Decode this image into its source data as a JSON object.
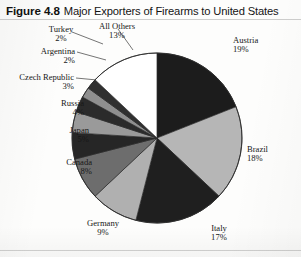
{
  "figure": {
    "number": "Figure 4.8",
    "title": "Major Exporters of Firearms to United States"
  },
  "chart_data": {
    "type": "pie",
    "title": "Major Exporters of Firearms to United States",
    "xlabel": "",
    "ylabel": "",
    "legend_position": "none-external-labels",
    "units": "percent",
    "categories": [
      "Austria",
      "Brazil",
      "Italy",
      "Germany",
      "Canada",
      "Japan",
      "Russia",
      "Czech Republic",
      "Argentina",
      "Turkey",
      "All Others"
    ],
    "values": [
      19,
      18,
      17,
      9,
      8,
      5,
      4,
      3,
      2,
      2,
      13
    ],
    "start_angle_deg": 0,
    "direction": "clockwise",
    "slices": [
      {
        "name": "Austria",
        "value": 19,
        "label": "Austria",
        "pct_label": "19%",
        "color": "#1c1c1c"
      },
      {
        "name": "Brazil",
        "value": 18,
        "label": "Brazil",
        "pct_label": "18%",
        "color": "#b6b6b6"
      },
      {
        "name": "Italy",
        "value": 17,
        "label": "Italy",
        "pct_label": "17%",
        "color": "#1f1f1f"
      },
      {
        "name": "Germany",
        "value": 9,
        "label": "Germany",
        "pct_label": "9%",
        "color": "#b0b0b0"
      },
      {
        "name": "Canada",
        "value": 8,
        "label": "Canada",
        "pct_label": "8%",
        "color": "#6d6d6d"
      },
      {
        "name": "Japan",
        "value": 5,
        "label": "Japan",
        "pct_label": "5%",
        "color": "#262626"
      },
      {
        "name": "Russia",
        "value": 4,
        "label": "Russia",
        "pct_label": "4%",
        "color": "#9a9a9a"
      },
      {
        "name": "Czech Republic",
        "value": 3,
        "label": "Czech Republic",
        "pct_label": "3%",
        "color": "#2b2b2b"
      },
      {
        "name": "Argentina",
        "value": 2,
        "label": "Argentina",
        "pct_label": "2%",
        "color": "#8f8f8f"
      },
      {
        "name": "Turkey",
        "value": 2,
        "label": "Turkey",
        "pct_label": "2%",
        "color": "#303030"
      },
      {
        "name": "All Others",
        "value": 13,
        "label": "All Others",
        "pct_label": "13%",
        "color": "#ffffff"
      }
    ]
  }
}
